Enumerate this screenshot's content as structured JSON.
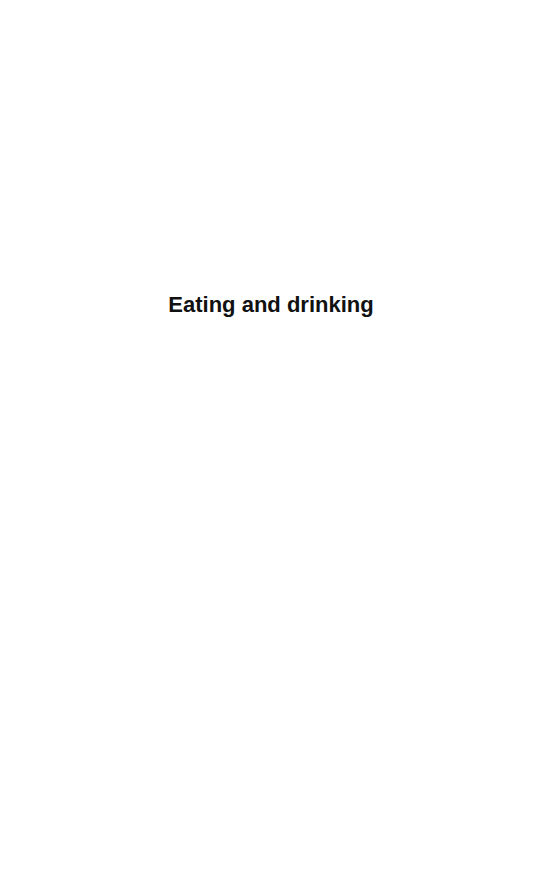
{
  "page": {
    "section_title": "Eating and drinking"
  }
}
